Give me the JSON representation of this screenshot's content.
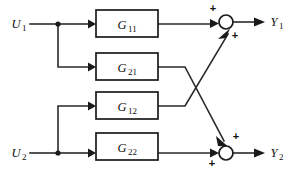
{
  "diagram": {
    "type": "control-block-diagram",
    "colors": {
      "background": "#ffffff",
      "line": "#2a2a2a",
      "block_stroke": "#1a1a1a",
      "text": "#111111"
    },
    "inputs": [
      {
        "id": "u1",
        "base": "U",
        "subscript": "1",
        "y": 24
      },
      {
        "id": "u2",
        "base": "U",
        "subscript": "2",
        "y": 153
      }
    ],
    "outputs": [
      {
        "id": "y1",
        "base": "Y",
        "subscript": "1",
        "y": 22
      },
      {
        "id": "y2",
        "base": "Y",
        "subscript": "2",
        "y": 153
      }
    ],
    "blocks": [
      {
        "id": "g11",
        "base": "G",
        "subscript": "11",
        "x": 96,
        "y": 10,
        "w": 62,
        "h": 27
      },
      {
        "id": "g21",
        "base": "G",
        "subscript": "21",
        "x": 96,
        "y": 53,
        "w": 62,
        "h": 27
      },
      {
        "id": "g12",
        "base": "G",
        "subscript": "12",
        "x": 96,
        "y": 92,
        "w": 62,
        "h": 27
      },
      {
        "id": "g22",
        "base": "G",
        "subscript": "22",
        "x": 96,
        "y": 133,
        "w": 62,
        "h": 27
      }
    ],
    "summing_junctions": [
      {
        "id": "sum-y1",
        "cx": 226,
        "cy": 22,
        "signs": [
          {
            "label": "+",
            "x": 213,
            "y": 12
          },
          {
            "label": "+",
            "x": 235,
            "y": 39
          }
        ]
      },
      {
        "id": "sum-y2",
        "cx": 226,
        "cy": 153,
        "signs": [
          {
            "label": "+",
            "x": 236,
            "y": 140
          },
          {
            "label": "+",
            "x": 212,
            "y": 167
          }
        ]
      }
    ],
    "branch_points": [
      {
        "id": "branch-u1",
        "x": 58,
        "y": 24
      },
      {
        "id": "branch-u2",
        "x": 58,
        "y": 153
      }
    ],
    "connections": [
      {
        "id": "u1-to-branch",
        "from": "u1",
        "to": "branch-u1"
      },
      {
        "id": "branch-to-g11",
        "from": "branch-u1",
        "to": "g11"
      },
      {
        "id": "branch-to-g21",
        "from": "branch-u1",
        "to": "g21"
      },
      {
        "id": "u2-to-branch",
        "from": "u2",
        "to": "branch-u2"
      },
      {
        "id": "branch-to-g22",
        "from": "branch-u2",
        "to": "g22"
      },
      {
        "id": "branch-to-g12",
        "from": "branch-u2",
        "to": "g12"
      },
      {
        "id": "g11-to-sum-y1",
        "from": "g11",
        "to": "sum-y1"
      },
      {
        "id": "g12-to-sum-y1",
        "from": "g12",
        "to": "sum-y1"
      },
      {
        "id": "g21-to-sum-y2",
        "from": "g21",
        "to": "sum-y2"
      },
      {
        "id": "g22-to-sum-y2",
        "from": "g22",
        "to": "sum-y2"
      },
      {
        "id": "sum-y1-to-y1",
        "from": "sum-y1",
        "to": "y1"
      },
      {
        "id": "sum-y2-to-y2",
        "from": "sum-y2",
        "to": "y2"
      }
    ]
  }
}
